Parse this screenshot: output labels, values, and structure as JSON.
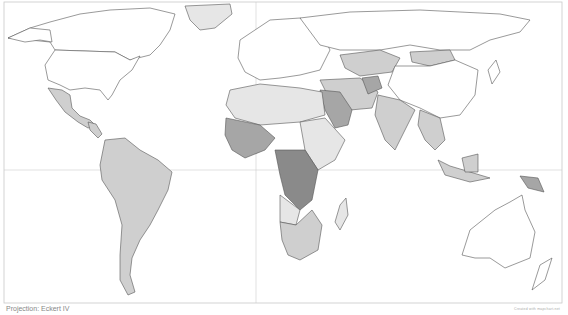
{
  "map": {
    "type": "choropleth world map",
    "projection_label": "Projection: Eckert IV",
    "credit": "Created with mapchart.net",
    "colors": {
      "none": "#ffffff",
      "light": "#e6e6e6",
      "medium": "#cfcfcf",
      "dark": "#a6a6a6",
      "darkest": "#8a8a8a",
      "border": "#555555",
      "frame": "#c8c8c8"
    },
    "shaded_regions": [
      {
        "region": "Mexico & Central America",
        "shade": "medium"
      },
      {
        "region": "South America",
        "shade": "medium"
      },
      {
        "region": "Greenland",
        "shade": "light"
      },
      {
        "region": "Kazakhstan / Mongolia",
        "shade": "medium"
      },
      {
        "region": "West Africa",
        "shade": "dark"
      },
      {
        "region": "Central Africa (DR Congo)",
        "shade": "darkest"
      },
      {
        "region": "Saudi Arabia / Iraq / Afghanistan",
        "shade": "dark"
      },
      {
        "region": "India & Southeast Asia",
        "shade": "medium"
      },
      {
        "region": "Indonesia",
        "shade": "medium"
      },
      {
        "region": "Papua New Guinea",
        "shade": "dark"
      },
      {
        "region": "Southern Africa",
        "shade": "medium"
      }
    ]
  }
}
